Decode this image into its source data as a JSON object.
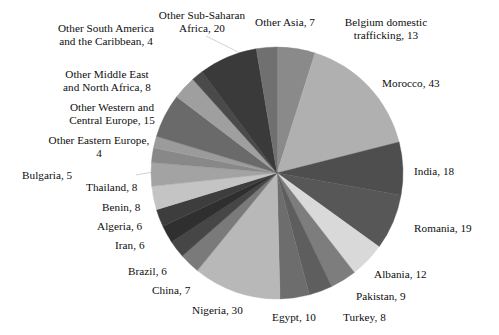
{
  "chart_data": {
    "type": "pie",
    "title": "",
    "subtitle": "",
    "xlabel": "",
    "ylabel": "",
    "legend_position": "none",
    "grid": false,
    "total": 260,
    "start_angle_deg": 0,
    "direction": "clockwise",
    "categories": [
      "Belgium domestic trafficking",
      "Morocco",
      "India",
      "Romania",
      "Albania",
      "Pakistan",
      "Turkey",
      "Egypt",
      "Nigeria",
      "China",
      "Brazil",
      "Iran",
      "Algeria",
      "Benin",
      "Thailand",
      "Bulgaria",
      "Other Eastern Europe",
      "Other Western and Central Europe",
      "Other Middle East and North Africa",
      "Other South America and the Caribbean",
      "Other Sub-Saharan Africa",
      "Other Asia"
    ],
    "values": [
      13,
      43,
      18,
      19,
      12,
      9,
      8,
      10,
      30,
      7,
      6,
      6,
      6,
      8,
      8,
      5,
      4,
      15,
      8,
      4,
      20,
      7
    ],
    "colors": [
      "#8a8a8a",
      "#b0b0b0",
      "#4e4e4e",
      "#575757",
      "#d9d9d9",
      "#7d7d7d",
      "#5e5e5e",
      "#6d6d6d",
      "#b8b8b8",
      "#7a7a7a",
      "#464646",
      "#2f2f2f",
      "#3d3d3d",
      "#c4c4c4",
      "#a3a3a3",
      "#888888",
      "#9b9b9b",
      "#6a6a6a",
      "#9f9f9f",
      "#4a4a4a",
      "#3a3a3a",
      "#707070"
    ],
    "labels": [
      {
        "name": "Belgium domestic trafficking",
        "value": 13,
        "text": "Belgium domestic\ntrafficking, 13"
      },
      {
        "name": "Morocco",
        "value": 43,
        "text": "Morocco, 43"
      },
      {
        "name": "India",
        "value": 18,
        "text": "India, 18"
      },
      {
        "name": "Romania",
        "value": 19,
        "text": "Romania, 19"
      },
      {
        "name": "Albania",
        "value": 12,
        "text": "Albania, 12"
      },
      {
        "name": "Pakistan",
        "value": 9,
        "text": "Pakistan, 9"
      },
      {
        "name": "Turkey",
        "value": 8,
        "text": "Turkey, 8"
      },
      {
        "name": "Egypt",
        "value": 10,
        "text": "Egypt, 10"
      },
      {
        "name": "Nigeria",
        "value": 30,
        "text": "Nigeria, 30"
      },
      {
        "name": "China",
        "value": 7,
        "text": "China, 7"
      },
      {
        "name": "Brazil",
        "value": 6,
        "text": "Brazil, 6"
      },
      {
        "name": "Iran",
        "value": 6,
        "text": "Iran, 6"
      },
      {
        "name": "Algeria",
        "value": 6,
        "text": "Algeria, 6"
      },
      {
        "name": "Benin",
        "value": 8,
        "text": "Benin, 8"
      },
      {
        "name": "Thailand",
        "value": 8,
        "text": "Thailand, 8"
      },
      {
        "name": "Bulgaria",
        "value": 5,
        "text": "Bulgaria, 5"
      },
      {
        "name": "Other Eastern Europe",
        "value": 4,
        "text": "Other Eastern Europe,\n4"
      },
      {
        "name": "Other Western and Central Europe",
        "value": 15,
        "text": "Other Western and\nCentral Europe, 15"
      },
      {
        "name": "Other Middle East and North Africa",
        "value": 8,
        "text": "Other Middle East\nand North Africa, 8"
      },
      {
        "name": "Other South America and the Caribbean",
        "value": 4,
        "text": "Other South America\nand the Caribbean, 4"
      },
      {
        "name": "Other Sub-Saharan Africa",
        "value": 20,
        "text": "Other Sub-Saharan\nAfrica, 20"
      },
      {
        "name": "Other Asia",
        "value": 7,
        "text": "Other Asia, 7"
      }
    ]
  },
  "labels_text": {
    "belgium": "Belgium domestic\ntrafficking, 13",
    "morocco": "Morocco, 43",
    "india": "India, 18",
    "romania": "Romania, 19",
    "albania": "Albania, 12",
    "pakistan": "Pakistan, 9",
    "turkey": "Turkey, 8",
    "egypt": "Egypt, 10",
    "nigeria": "Nigeria, 30",
    "china": "China, 7",
    "brazil": "Brazil, 6",
    "iran": "Iran, 6",
    "algeria": "Algeria, 6",
    "benin": "Benin, 8",
    "thailand": "Thailand, 8",
    "bulgaria": "Bulgaria, 5",
    "other_eastern_europe": "Other Eastern Europe,\n4",
    "other_western_central_europe": "Other Western and\nCentral Europe, 15",
    "other_mena": "Other Middle East\nand North Africa, 8",
    "other_south_america": "Other South America\nand the Caribbean, 4",
    "other_sub_saharan": "Other Sub-Saharan\nAfrica, 20",
    "other_asia": "Other Asia, 7"
  },
  "geometry": {
    "center_x": 277,
    "center_y": 173,
    "radius": 126
  }
}
